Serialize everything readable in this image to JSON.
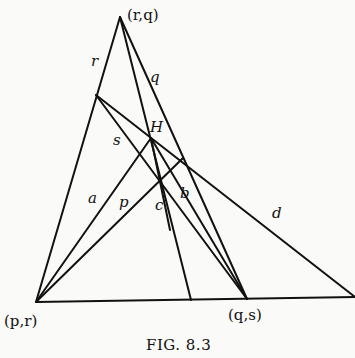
{
  "figure": {
    "caption": "Fig. 8.3",
    "caption_display": "FIG. 8.3",
    "points": {
      "apex": {
        "label": "(r,q)",
        "x": 120,
        "y": 17
      },
      "bottom_left": {
        "label": "(p,r)",
        "x": 36,
        "y": 302
      },
      "bottom_mid": {
        "label": "(q,s)",
        "x": 247,
        "y": 299
      },
      "H": {
        "label": "H",
        "x": 151,
        "y": 138
      }
    },
    "line_labels": {
      "r": "r",
      "q": "q",
      "s": "s",
      "a": "a",
      "p": "p",
      "c": "c",
      "b": "b",
      "d": "d"
    },
    "colors": {
      "ink": "#111111",
      "paper": "#fafaf8"
    }
  }
}
